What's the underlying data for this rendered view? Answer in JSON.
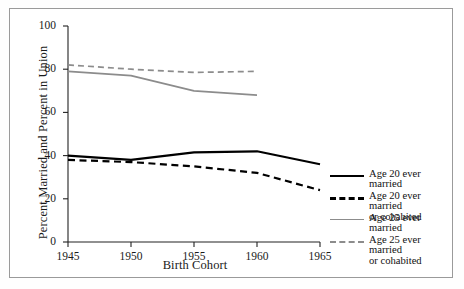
{
  "chart_data": {
    "type": "line",
    "title": "",
    "xlabel": "Birth Cohort",
    "ylabel": "Percent Married and Percent in Union",
    "x": [
      1945,
      1950,
      1955,
      1960,
      1965
    ],
    "xlim": [
      1945,
      1965
    ],
    "ylim": [
      0,
      100
    ],
    "xticks": [
      "1945",
      "1950",
      "1955",
      "1960",
      "1965"
    ],
    "yticks": [
      "0",
      "20",
      "40",
      "60",
      "80",
      "100"
    ],
    "grid": false,
    "legend_position": "right",
    "series": [
      {
        "name": "Age 20 ever married",
        "style": "solid",
        "color": "#000000",
        "x": [
          1945,
          1950,
          1955,
          1960,
          1965
        ],
        "values": [
          40,
          38,
          41.5,
          42,
          36
        ]
      },
      {
        "name": "Age 20 ever married or cohabited",
        "style": "dashed",
        "color": "#000000",
        "x": [
          1945,
          1950,
          1955,
          1960,
          1965
        ],
        "values": [
          38,
          37,
          35,
          32,
          24
        ]
      },
      {
        "name": "Age 25 ever married",
        "style": "solid",
        "color": "#8c8c8c",
        "x": [
          1945,
          1950,
          1955,
          1960
        ],
        "values": [
          79,
          77,
          70,
          68
        ]
      },
      {
        "name": "Age 25 ever married or cohabited",
        "style": "dashed",
        "color": "#8c8c8c",
        "x": [
          1945,
          1950,
          1955,
          1960
        ],
        "values": [
          82,
          80,
          78.5,
          79
        ]
      }
    ]
  },
  "legend": {
    "items": [
      {
        "label_line1": "Age 20 ever married",
        "label_line2": ""
      },
      {
        "label_line1": "Age 20 ever married",
        "label_line2": "or cohabited"
      },
      {
        "label_line1": "Age 25 ever married",
        "label_line2": ""
      },
      {
        "label_line1": "Age 25 ever married",
        "label_line2": "or cohabited"
      }
    ]
  }
}
